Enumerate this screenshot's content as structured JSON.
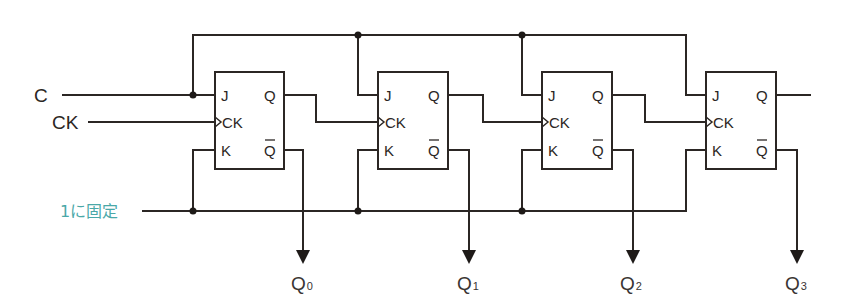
{
  "diagram": {
    "colors": {
      "wire": "#2b2624",
      "fixed_label": "#4aa8a8"
    },
    "inputs": {
      "c_label": "C",
      "ck_label": "CK",
      "fixed_label": "1に固定"
    },
    "flip_flops": [
      {
        "id": "ff0",
        "pins": {
          "j": "J",
          "ck": "CK",
          "k": "K",
          "q": "Q",
          "qbar": "Q"
        },
        "output": {
          "name": "Q",
          "sub": "0"
        }
      },
      {
        "id": "ff1",
        "pins": {
          "j": "J",
          "ck": "CK",
          "k": "K",
          "q": "Q",
          "qbar": "Q"
        },
        "output": {
          "name": "Q",
          "sub": "1"
        }
      },
      {
        "id": "ff2",
        "pins": {
          "j": "J",
          "ck": "CK",
          "k": "K",
          "q": "Q",
          "qbar": "Q"
        },
        "output": {
          "name": "Q",
          "sub": "2"
        }
      },
      {
        "id": "ff3",
        "pins": {
          "j": "J",
          "ck": "CK",
          "k": "K",
          "q": "Q",
          "qbar": "Q"
        },
        "output": {
          "name": "Q",
          "sub": "3"
        }
      }
    ]
  }
}
